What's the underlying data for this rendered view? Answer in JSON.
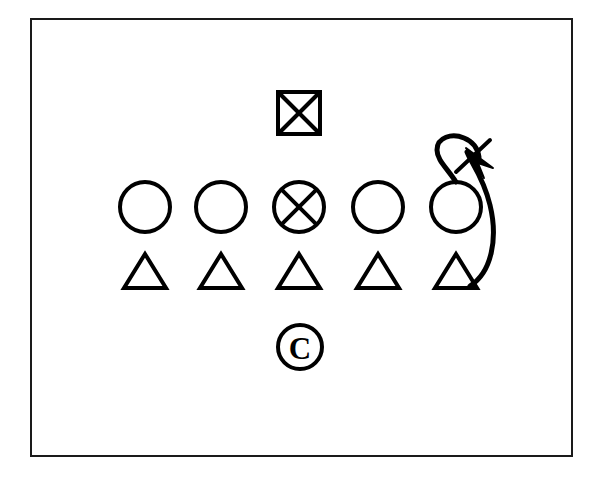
{
  "diagram": {
    "title": "Football Play Formation Diagram",
    "type": "sports-play-diagram",
    "background_color": "#FFFFFF",
    "ink_color": "#000000",
    "frame": {
      "x": 31,
      "y": 19,
      "width": 541,
      "height": 437,
      "stroke_width": 2,
      "stroke_color": "#1A1A1A"
    },
    "ball_marker": {
      "label": "square-x",
      "symbol": "boxed-x",
      "meaning": "ball",
      "x": 278,
      "y": 92,
      "size": 42,
      "stroke_width": 4
    },
    "offense_row": {
      "label": "offensive-line",
      "symbol": "circle",
      "count": 5,
      "center_y": 207,
      "radius": 25,
      "stroke_width": 4,
      "players": [
        {
          "id": "o1",
          "label": "O",
          "cx": 145,
          "marked": false
        },
        {
          "id": "o2",
          "label": "O",
          "cx": 221,
          "marked": false
        },
        {
          "id": "o3",
          "label": "O-X",
          "cx": 299,
          "marked": true
        },
        {
          "id": "o4",
          "label": "O",
          "cx": 378,
          "marked": false
        },
        {
          "id": "o5",
          "label": "O",
          "cx": 456,
          "marked": false
        }
      ]
    },
    "defense_row": {
      "label": "defensive-line",
      "symbol": "triangle",
      "count": 5,
      "base_y": 288,
      "apex_y": 254,
      "half_width": 21,
      "stroke_width": 4,
      "players": [
        {
          "id": "d1",
          "label": "T",
          "cx": 145
        },
        {
          "id": "d2",
          "label": "T",
          "cx": 221
        },
        {
          "id": "d3",
          "label": "T",
          "cx": 299
        },
        {
          "id": "d4",
          "label": "T",
          "cx": 378
        },
        {
          "id": "d5",
          "label": "T",
          "cx": 456
        }
      ]
    },
    "center_marker": {
      "label": "C",
      "symbol": "circled-c",
      "meaning": "center",
      "cx": 300,
      "cy": 347,
      "radius": 22,
      "stroke_width": 4,
      "letter": "C"
    },
    "route": {
      "label": "loop-route",
      "meaning": "motion-path-with-arrow",
      "stroke_width": 5,
      "path": "M 470 286 C 492 272, 498 238, 490 205 C 483 176, 470 161, 467 152",
      "loop_path": "M 456 182 C 447 168, 437 160, 437 150 C 437 137, 452 133, 464 138 C 474 142, 478 150, 479 157",
      "arrow_head": {
        "label": "arrowhead",
        "points": "466,148 484,178 478,163 493,168",
        "tip_x": 466,
        "tip_y": 148
      },
      "slash": {
        "label": "slash-tick",
        "x1": 456,
        "y1": 172,
        "x2": 490,
        "y2": 140,
        "stroke_width": 4
      }
    },
    "legend": {
      "circle_meaning": "offensive player",
      "circle_x_meaning": "marked offensive player",
      "triangle_meaning": "defensive player",
      "square_x_meaning": "ball",
      "circled_c_meaning": "center / coach",
      "arrow_meaning": "player motion path"
    }
  }
}
